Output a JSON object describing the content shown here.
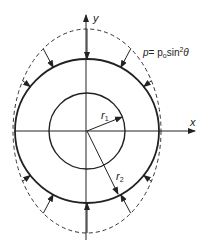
{
  "diagram": {
    "axes": {
      "x_label": "x",
      "y_label": "y"
    },
    "load_label": {
      "p": "p",
      "eq": "= p",
      "sub": "o",
      "fn": "sin",
      "sup": "2",
      "theta": "θ"
    },
    "radii": {
      "inner": {
        "r": "r",
        "sub": "1"
      },
      "outer": {
        "r": "r",
        "sub": "2"
      }
    },
    "load_distribution": "p = p_o sin^2(theta)",
    "arrow_angles_deg": [
      90,
      62,
      38,
      118,
      142,
      270,
      242,
      218,
      298,
      322
    ],
    "colors": {
      "stroke": "#222222",
      "background": "#ffffff"
    }
  }
}
